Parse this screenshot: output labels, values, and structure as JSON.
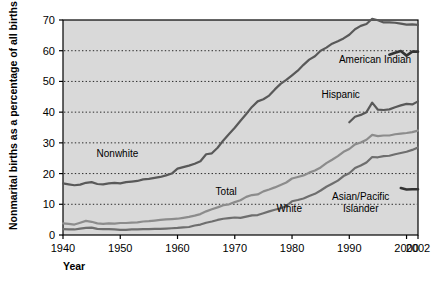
{
  "chart_data": {
    "type": "line",
    "title": "",
    "xlabel": "Year",
    "ylabel": "Nonmarital births as a percentage of all births",
    "xlim": [
      1940,
      2002
    ],
    "ylim": [
      0,
      70
    ],
    "yticks": [
      0,
      10,
      20,
      30,
      40,
      50,
      60,
      70
    ],
    "xticks": [
      1940,
      1950,
      1960,
      1970,
      1980,
      1990,
      2000,
      2002
    ],
    "xtick_labels": [
      "1940",
      "1950",
      "1960",
      "1970",
      "1980",
      "1990",
      "2000",
      "2002"
    ],
    "ytick_labels": [
      "0",
      "10",
      "20",
      "30",
      "40",
      "50",
      "60",
      "70"
    ],
    "grid": "horizontal-dotted",
    "legend": "inline-annotations",
    "plot_background": "#d9d9d9",
    "series": [
      {
        "name": "Nonwhite",
        "label": "Nonwhite",
        "color": "#595959",
        "label_x": 1949.5,
        "label_y": 25.5,
        "x": [
          1940,
          1941,
          1942,
          1943,
          1944,
          1945,
          1946,
          1947,
          1948,
          1949,
          1950,
          1951,
          1952,
          1953,
          1954,
          1955,
          1956,
          1957,
          1958,
          1959,
          1960,
          1961,
          1962,
          1963,
          1964,
          1965,
          1966,
          1967,
          1968,
          1969,
          1970,
          1971,
          1972,
          1973,
          1974,
          1975,
          1976,
          1977,
          1978,
          1979,
          1980,
          1981,
          1982,
          1983,
          1984,
          1985,
          1986,
          1987,
          1988,
          1989,
          1990,
          1991,
          1992,
          1993,
          1994,
          1995,
          1996,
          1997,
          1998,
          1999,
          2000,
          2001,
          2002
        ],
        "y": [
          16.8,
          16.5,
          16.2,
          16.4,
          17.0,
          17.2,
          16.6,
          16.5,
          16.8,
          17.0,
          16.8,
          17.2,
          17.4,
          17.6,
          18.1,
          18.3,
          18.6,
          18.9,
          19.4,
          20.0,
          21.6,
          22.1,
          22.6,
          23.2,
          24.0,
          26.3,
          26.6,
          28.4,
          30.8,
          32.9,
          34.9,
          37.2,
          39.4,
          41.7,
          43.5,
          44.2,
          45.4,
          47.4,
          49.2,
          50.5,
          52.0,
          53.5,
          55.4,
          57.1,
          58.2,
          60.0,
          61.0,
          62.3,
          63.1,
          64.0,
          65.2,
          67.0,
          68.1,
          68.7,
          70.4,
          69.9,
          69.2,
          69.2,
          69.1,
          68.8,
          68.5,
          68.6,
          68.4
        ]
      },
      {
        "name": "Total",
        "label": "Total",
        "color": "#8c8c8c",
        "label_x": 1968.5,
        "label_y": 13.0,
        "x": [
          1940,
          1941,
          1942,
          1943,
          1944,
          1945,
          1946,
          1947,
          1948,
          1949,
          1950,
          1951,
          1952,
          1953,
          1954,
          1955,
          1956,
          1957,
          1958,
          1959,
          1960,
          1961,
          1962,
          1963,
          1964,
          1965,
          1966,
          1967,
          1968,
          1969,
          1970,
          1971,
          1972,
          1973,
          1974,
          1975,
          1976,
          1977,
          1978,
          1979,
          1980,
          1981,
          1982,
          1983,
          1984,
          1985,
          1986,
          1987,
          1988,
          1989,
          1990,
          1991,
          1992,
          1993,
          1994,
          1995,
          1996,
          1997,
          1998,
          1999,
          2000,
          2001,
          2002
        ],
        "y": [
          3.8,
          3.6,
          3.4,
          4.0,
          4.6,
          4.3,
          3.8,
          3.6,
          3.8,
          3.7,
          3.9,
          3.9,
          4.0,
          4.1,
          4.4,
          4.5,
          4.7,
          4.9,
          5.1,
          5.2,
          5.3,
          5.6,
          5.9,
          6.3,
          6.8,
          7.7,
          8.4,
          9.0,
          9.7,
          10.0,
          10.7,
          11.3,
          12.4,
          13.0,
          13.2,
          14.2,
          14.8,
          15.5,
          16.3,
          17.1,
          18.4,
          18.9,
          19.4,
          20.3,
          21.0,
          22.0,
          23.4,
          24.5,
          25.7,
          27.1,
          28.0,
          29.5,
          30.1,
          31.0,
          32.6,
          32.2,
          32.4,
          32.4,
          32.8,
          33.0,
          33.2,
          33.5,
          34.0
        ]
      },
      {
        "name": "White",
        "label": "White",
        "color": "#6e6e6e",
        "label_x": 1979.5,
        "label_y": 7.5,
        "x": [
          1940,
          1941,
          1942,
          1943,
          1944,
          1945,
          1946,
          1947,
          1948,
          1949,
          1950,
          1951,
          1952,
          1953,
          1954,
          1955,
          1956,
          1957,
          1958,
          1959,
          1960,
          1961,
          1962,
          1963,
          1964,
          1965,
          1966,
          1967,
          1968,
          1969,
          1970,
          1971,
          1972,
          1973,
          1974,
          1975,
          1976,
          1977,
          1978,
          1979,
          1980,
          1981,
          1982,
          1983,
          1984,
          1985,
          1986,
          1987,
          1988,
          1989,
          1990,
          1991,
          1992,
          1993,
          1994,
          1995,
          1996,
          1997,
          1998,
          1999,
          2000,
          2001,
          2002
        ],
        "y": [
          1.9,
          1.8,
          1.8,
          2.1,
          2.3,
          2.4,
          2.0,
          1.9,
          1.9,
          1.8,
          1.7,
          1.7,
          1.8,
          1.8,
          1.9,
          1.9,
          2.0,
          2.0,
          2.1,
          2.2,
          2.3,
          2.5,
          2.6,
          3.1,
          3.4,
          4.0,
          4.4,
          4.9,
          5.3,
          5.5,
          5.7,
          5.6,
          6.0,
          6.4,
          6.5,
          7.1,
          7.7,
          8.2,
          8.7,
          9.4,
          11.0,
          11.4,
          11.9,
          12.7,
          13.4,
          14.5,
          15.7,
          16.7,
          17.7,
          19.2,
          20.1,
          21.8,
          22.6,
          23.6,
          25.4,
          25.3,
          25.7,
          25.8,
          26.3,
          26.7,
          27.1,
          27.7,
          28.5
        ]
      },
      {
        "name": "Hispanic",
        "label": "Hispanic",
        "color": "#595959",
        "label_x": 1988.5,
        "label_y": 44.5,
        "x": [
          1990,
          1991,
          1992,
          1993,
          1994,
          1995,
          1996,
          1997,
          1998,
          1999,
          2000,
          2001,
          2002
        ],
        "y": [
          36.7,
          38.5,
          39.1,
          40.0,
          43.1,
          40.8,
          40.7,
          40.9,
          41.6,
          42.2,
          42.7,
          42.5,
          43.5
        ]
      },
      {
        "name": "American Indian",
        "label": "American Indian",
        "color": "#333333",
        "label_x": 1994.5,
        "label_y": 56.0,
        "x": [
          1997,
          1998,
          1999,
          2000,
          2001,
          2002
        ],
        "y": [
          58.7,
          59.3,
          59.9,
          58.4,
          59.7,
          59.7
        ]
      },
      {
        "name": "Asian/Pacific Islander",
        "label_line1": "Asian/Pacific",
        "label_line2": "Islander",
        "color": "#333333",
        "label_x": 1992.0,
        "label_y": 11.5,
        "x": [
          1999,
          2000,
          2001,
          2002
        ],
        "y": [
          15.3,
          14.8,
          14.9,
          14.9
        ]
      }
    ]
  }
}
